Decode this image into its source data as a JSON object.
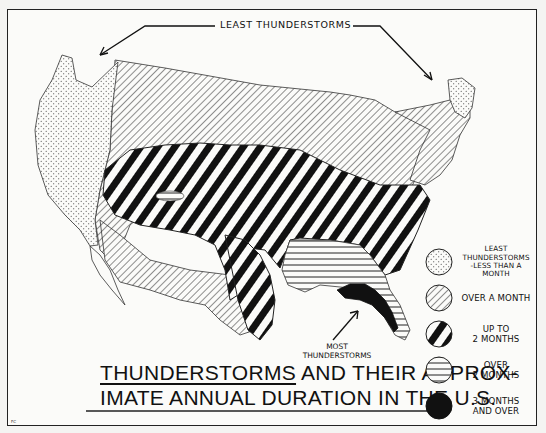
{
  "map": {
    "title_part1_underlined": "THUNDERSTORMS",
    "title_part1_rest": " AND THEIR APPROX-",
    "title_line2": "IMATE ANNUAL DURATION IN THE U.S.",
    "subject": "Contiguous United States",
    "annotations": {
      "least": "LEAST THUNDERSTORMS",
      "most_line1": "MOST",
      "most_line2": "THUNDERSTORMS"
    },
    "artist_initials": "FC"
  },
  "legend": {
    "items": [
      {
        "pattern": "dots",
        "label_line1": "LEAST",
        "label_line2": "THUNDERSTORMS",
        "label_line3": "-LESS THAN A MONTH"
      },
      {
        "pattern": "fine-diagonal",
        "label_line1": "OVER A MONTH"
      },
      {
        "pattern": "bold-diagonal",
        "label_line1": "UP TO",
        "label_line2": "2 MONTHS"
      },
      {
        "pattern": "horizontal-lines",
        "label_line1": "OVER",
        "label_line2": "2 MONTHS"
      },
      {
        "pattern": "solid-black",
        "label_line1": "3 MONTHS",
        "label_line2": "AND OVER"
      }
    ]
  },
  "regions": [
    {
      "category": "less than a month",
      "areas": [
        "Pacific coast (WA, OR, CA, NV west)",
        "Northern New England (Maine)"
      ]
    },
    {
      "category": "over a month",
      "areas": [
        "Northern plains & Rockies",
        "Great Lakes region",
        "Mid-Atlantic/New England",
        "Southwest (AZ, NM, west TX)"
      ]
    },
    {
      "category": "up to 2 months",
      "areas": [
        "Central plains & Midwest belt",
        "Ohio Valley",
        "East Texas",
        "Southeast Atlantic coast"
      ]
    },
    {
      "category": "over 2 months",
      "areas": [
        "Gulf states (LA, MS, AL, GA)",
        "Peninsular Florida",
        "Small area in Colorado"
      ]
    },
    {
      "category": "3 months and over",
      "areas": [
        "Florida panhandle & northern Florida"
      ]
    }
  ]
}
